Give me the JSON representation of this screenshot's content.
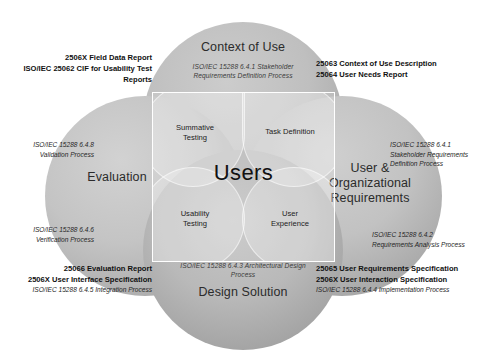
{
  "diagram": {
    "center": {
      "label": "Users",
      "quadrants": [
        {
          "id": "summative-testing",
          "label": "Summative\nTesting"
        },
        {
          "id": "task-definition",
          "label": "Task Definition"
        },
        {
          "id": "usability-testing",
          "label": "Usability\nTesting"
        },
        {
          "id": "user-experience",
          "label": "User\nExperience"
        }
      ]
    },
    "lobes": [
      {
        "id": "context-of-use",
        "title": "Context of Use",
        "process": "ISO/IEC 15288 6.4.1 Stakeholder\nRequirements Definition Process"
      },
      {
        "id": "evaluation",
        "title": "Evaluation",
        "process": ""
      },
      {
        "id": "user-organizational-requirements",
        "title": "User &\nOrganizational\nRequirements",
        "process": ""
      },
      {
        "id": "design-solution",
        "title": "Design Solution",
        "process": "ISO/IEC 15288 6.4.3 Architectural Design\nProcess"
      }
    ],
    "annotations": {
      "top_left": {
        "lines": [
          {
            "text": "2506X  Field Data Report",
            "style": "bold"
          },
          {
            "text": "ISO/IEC 25062  CIF for Usability Test",
            "style": "bold"
          },
          {
            "text": "Reports",
            "style": "bold"
          }
        ]
      },
      "top_right": {
        "lines": [
          {
            "text": "25063  Context of Use Description",
            "style": "bold"
          },
          {
            "text": "25064  User Needs Report",
            "style": "bold"
          }
        ]
      },
      "left_upper": {
        "lines": [
          {
            "text": "ISO/IEC 15288 6.4.8",
            "style": "italic"
          },
          {
            "text": "Validation Process",
            "style": "italic"
          }
        ]
      },
      "left_lower": {
        "lines": [
          {
            "text": "ISO/IEC 15288 6.4.6",
            "style": "italic"
          },
          {
            "text": "Verification  Process",
            "style": "italic"
          }
        ]
      },
      "right_upper": {
        "lines": [
          {
            "text": "ISO/IEC 15288 6.4.1",
            "style": "italic"
          },
          {
            "text": "Stakeholder Requirements",
            "style": "italic"
          },
          {
            "text": "Definition Process",
            "style": "italic"
          }
        ]
      },
      "right_lower": {
        "lines": [
          {
            "text": "ISO/IEC 15288 6.4.2",
            "style": "italic"
          },
          {
            "text": "Requirements Analysis Process",
            "style": "italic"
          }
        ]
      },
      "bottom_left": {
        "lines": [
          {
            "text": "25066  Evaluation Report",
            "style": "bold"
          },
          {
            "text": "2506X  User Interface Specification",
            "style": "bold"
          },
          {
            "text": "ISO/IEC 15288 6.4.5 Integration  Process",
            "style": "italic"
          }
        ]
      },
      "bottom_right": {
        "lines": [
          {
            "text": "25065  User Requirements Specification",
            "style": "bold"
          },
          {
            "text": "2506X  User Interaction Specification",
            "style": "bold"
          },
          {
            "text": "ISO/IEC 15288 6.4.4 Implementation  Process",
            "style": "italic"
          }
        ]
      }
    },
    "colors": {
      "background": "#ffffff",
      "lobe_gray": "#bfbfbf",
      "square_outline": "#ffffff",
      "text": "#111111"
    }
  }
}
